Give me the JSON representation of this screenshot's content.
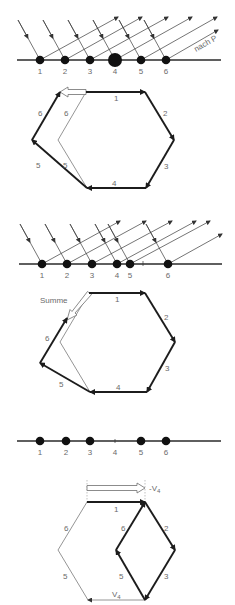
{
  "figure": {
    "panel1": {
      "emitters": [
        {
          "label": "1",
          "strength": "normal"
        },
        {
          "label": "2",
          "strength": "normal"
        },
        {
          "label": "3",
          "strength": "normal"
        },
        {
          "label": "4",
          "strength": "large"
        },
        {
          "label": "5",
          "strength": "normal"
        },
        {
          "label": "6",
          "strength": "normal"
        }
      ],
      "direction_label": "nach P"
    },
    "hexagon1": {
      "segment_labels": [
        "1",
        "2",
        "3",
        "4",
        "5",
        "6"
      ],
      "thin_labels": [
        "6",
        "5"
      ]
    },
    "panel2": {
      "emitters": [
        {
          "label": "1",
          "strength": "normal"
        },
        {
          "label": "2",
          "strength": "normal"
        },
        {
          "label": "3",
          "strength": "normal"
        },
        {
          "label": "4",
          "strength": "normal"
        },
        {
          "label": "5",
          "strength": "normal"
        },
        {
          "label": "6",
          "strength": "normal"
        }
      ]
    },
    "hexagon2": {
      "segment_labels": [
        "1",
        "2",
        "3",
        "4",
        "5",
        "6"
      ],
      "sum_label": "Summe"
    },
    "panel3": {
      "emitters": [
        {
          "label": "1",
          "strength": "normal"
        },
        {
          "label": "2",
          "strength": "normal"
        },
        {
          "label": "3",
          "strength": "normal"
        },
        {
          "label": "4",
          "strength": "missing"
        },
        {
          "label": "5",
          "strength": "normal"
        },
        {
          "label": "6",
          "strength": "normal"
        }
      ]
    },
    "hexagon3": {
      "segment_labels": [
        "1",
        "2",
        "3",
        "5",
        "6"
      ],
      "thin_labels": [
        "6",
        "5"
      ],
      "vector_label": "V",
      "vector_subscript": "4",
      "neg_vector_prefix": "-V",
      "neg_vector_subscript": "4"
    }
  }
}
